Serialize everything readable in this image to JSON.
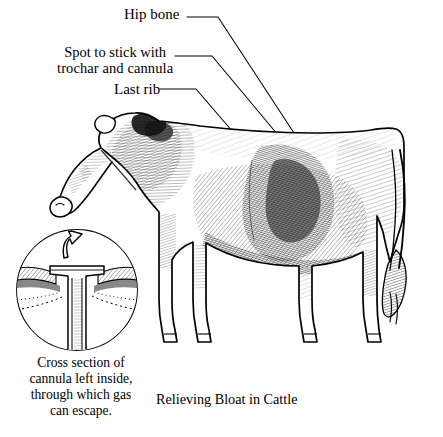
{
  "figure": {
    "title": "Relieving Bloat in Cattle",
    "background_color": "#ffffff",
    "ink_color": "#000000",
    "width": 443,
    "height": 437
  },
  "callouts": {
    "hip_bone": {
      "label": "Hip bone",
      "icon": "leader-line-icon"
    },
    "spot_to_stick": {
      "line1": "Spot to stick with",
      "line2": "trochar and cannula",
      "icon": "leader-line-icon",
      "marker": "puncture-site-marker"
    },
    "last_rib": {
      "label": "Last rib",
      "icon": "leader-line-icon"
    }
  },
  "inset": {
    "shape": "circle-inset",
    "arrow_icon": "gas-escape-arrow-icon",
    "device_icon": "cannula-cross-section-icon",
    "caption_lines": [
      "Cross section of",
      "cannula left  inside,",
      "through which gas",
      "can escape."
    ]
  },
  "caption": {
    "text": "Relieving Bloat in Cattle"
  },
  "illustration": {
    "subject": "cow-side-view-illustration",
    "style": "pen-and-ink-engraving-hatching"
  }
}
